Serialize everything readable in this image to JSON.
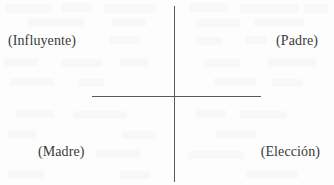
{
  "figure": {
    "type": "quadrant-diagram",
    "background_color": "#fdfdfd",
    "axis_color": "#5a5a5a",
    "text_color": "#3a3a3a",
    "quadrants": {
      "top_left": "(Influyente)",
      "top_right": "(Padre)",
      "bottom_left": "(Madre)",
      "bottom_right": "(Elección)"
    }
  }
}
